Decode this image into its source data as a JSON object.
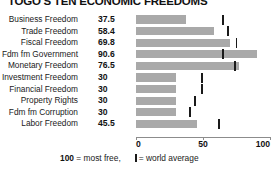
{
  "title": "TOGO'S TEN ECONOMIC FREEDOMS",
  "legend": {
    "scale_note_value": "100",
    "scale_note_text": " = most free,",
    "average_glyph_name": "world-average-tick-icon",
    "average_text": "= world average"
  },
  "axis": {
    "ticks": [
      "0",
      "50",
      "100"
    ],
    "min": 0,
    "max": 100
  },
  "chart_data": {
    "type": "bar",
    "title": "TOGO'S TEN ECONOMIC FREEDOMS",
    "xlabel": "",
    "ylabel": "",
    "xlim": [
      0,
      100
    ],
    "grid": false,
    "orientation": "horizontal",
    "legend_position": "bottom",
    "bar_color": "#a9a9a9",
    "marker_color": "#1a1a1a",
    "value_note": "100 = most free",
    "marker_note": "world average",
    "categories": [
      "Business Freedom",
      "Trade Freedom",
      "Fiscal Freedom",
      "Fdm fm Government",
      "Monetary Freedom",
      "Investment Freedom",
      "Financial Freedom",
      "Property Rights",
      "Fdm fm Corruption",
      "Labor Freedom"
    ],
    "values": [
      37.5,
      58.4,
      69.8,
      90.6,
      76.5,
      30,
      30,
      30,
      30,
      45.5
    ],
    "value_labels": [
      "37.5",
      "58.4",
      "69.8",
      "90.6",
      "76.5",
      "30",
      "30",
      "30",
      "30",
      "45.5"
    ],
    "world_average": [
      64.7,
      68.6,
      74.9,
      65.0,
      74.0,
      49.0,
      49.0,
      44.0,
      40.5,
      62.1
    ]
  }
}
